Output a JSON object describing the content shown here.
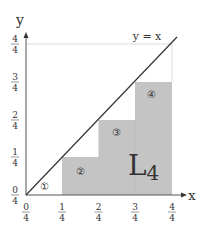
{
  "diagram": {
    "axes": {
      "x_label": "x",
      "y_label": "y",
      "x_ticks": [
        {
          "num": "0",
          "den": "4"
        },
        {
          "num": "1",
          "den": "4"
        },
        {
          "num": "2",
          "den": "4"
        },
        {
          "num": "3",
          "den": "4"
        },
        {
          "num": "4",
          "den": "4"
        }
      ],
      "y_ticks": [
        {
          "num": "0",
          "den": "4"
        },
        {
          "num": "1",
          "den": "4"
        },
        {
          "num": "2",
          "den": "4"
        },
        {
          "num": "3",
          "den": "4"
        },
        {
          "num": "4",
          "den": "4"
        }
      ]
    },
    "line_label": "y = x",
    "sum_label": "L",
    "sum_subscript": "4",
    "regions": [
      {
        "id": "1",
        "label": "①",
        "shaded": false
      },
      {
        "id": "2",
        "label": "②",
        "shaded": true
      },
      {
        "id": "3",
        "label": "③",
        "shaded": true
      },
      {
        "id": "4",
        "label": "④",
        "shaded": true
      }
    ],
    "colors": {
      "bar_fill": "#c4c4c4",
      "axis": "#555555",
      "line": "#333333",
      "guide": "#dddddd"
    }
  }
}
